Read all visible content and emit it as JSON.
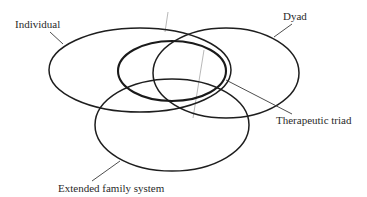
{
  "diagram": {
    "type": "overlapping-ellipses",
    "labels": {
      "individual": "Individual",
      "dyad": "Dyad",
      "therapeutic_triad": "Therapeutic triad",
      "extended_family": "Extended family system"
    },
    "colors": {
      "stroke": "#1e1e1e",
      "text": "#2a2a2a",
      "background": "#ffffff"
    }
  }
}
